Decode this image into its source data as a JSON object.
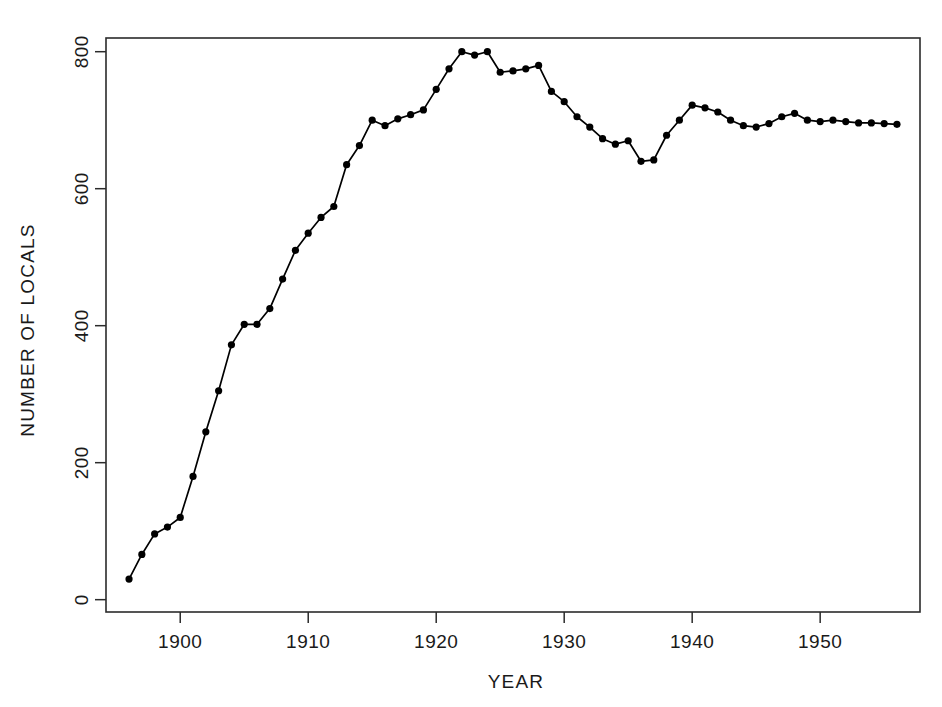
{
  "figure": {
    "background_color": "#ffffff",
    "line_color": "#000000",
    "axis_color": "#2b2b2b",
    "frame": "box"
  },
  "chart_data": {
    "type": "line",
    "title": "",
    "subtitle": "",
    "xlabel": "YEAR",
    "ylabel": "NUMBER OF LOCALS",
    "xlim": [
      1894.2,
      1957.8
    ],
    "ylim": [
      -18,
      820
    ],
    "xticks": [
      1900,
      1910,
      1920,
      1930,
      1940,
      1950
    ],
    "xtick_labels": [
      "1900",
      "1910",
      "1920",
      "1930",
      "1940",
      "1950"
    ],
    "yticks": [
      0,
      200,
      400,
      600,
      800
    ],
    "ytick_labels": [
      "0",
      "200",
      "400",
      "600",
      "800"
    ],
    "grid": false,
    "legend": false,
    "legend_position": "none",
    "marker": "filled-circle",
    "marker_size": 4,
    "annotations": [],
    "series": [
      {
        "name": "Number of locals",
        "x": [
          1896,
          1897,
          1898,
          1899,
          1900,
          1901,
          1902,
          1903,
          1904,
          1905,
          1906,
          1907,
          1908,
          1909,
          1910,
          1911,
          1912,
          1913,
          1914,
          1915,
          1916,
          1917,
          1918,
          1919,
          1920,
          1921,
          1922,
          1923,
          1924,
          1925,
          1926,
          1927,
          1928,
          1929,
          1930,
          1931,
          1932,
          1933,
          1934,
          1935,
          1936,
          1937,
          1938,
          1939,
          1940,
          1941,
          1942,
          1943,
          1944,
          1945,
          1946,
          1947,
          1948,
          1949,
          1950,
          1951,
          1952,
          1953,
          1954,
          1955,
          1956
        ],
        "values": [
          30,
          66,
          96,
          106,
          120,
          180,
          245,
          305,
          372,
          402,
          402,
          425,
          468,
          510,
          535,
          558,
          574,
          635,
          663,
          700,
          692,
          702,
          708,
          715,
          745,
          775,
          800,
          795,
          800,
          770,
          772,
          775,
          780,
          742,
          727,
          705,
          690,
          673,
          665,
          670,
          640,
          642,
          678,
          700,
          722,
          718,
          712,
          700,
          692,
          690,
          695,
          705,
          710,
          700,
          698,
          700,
          698,
          696,
          696,
          695,
          694
        ]
      }
    ]
  }
}
